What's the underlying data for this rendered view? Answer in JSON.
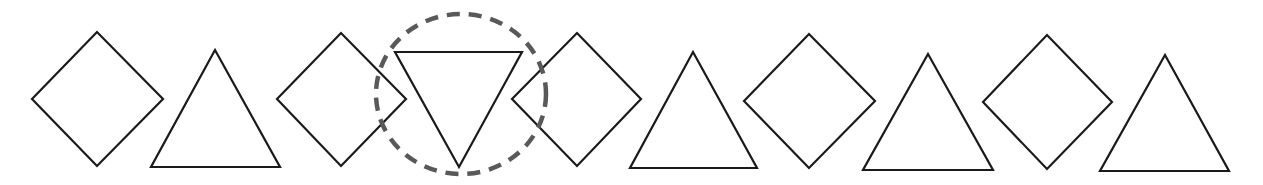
{
  "diagram": {
    "title": "",
    "stroke_color": "#1a1a1a",
    "highlight_color": "#595959",
    "shapes": [
      {
        "index": 1,
        "type": "diamond",
        "points": "32,99 97,32 163,99 97,166"
      },
      {
        "index": 2,
        "type": "triangle-up",
        "points": "215,50 280,167 151,167"
      },
      {
        "index": 3,
        "type": "diamond",
        "points": "277,99 341,33 406,99 341,166"
      },
      {
        "index": 4,
        "type": "triangle-down",
        "points": "395,52 522,52 459,167",
        "highlighted": true
      },
      {
        "index": 5,
        "type": "diamond",
        "points": "512,99 577,33 641,99 577,166"
      },
      {
        "index": 6,
        "type": "triangle-up",
        "points": "693,52 757,168 630,168"
      },
      {
        "index": 7,
        "type": "diamond",
        "points": "744,101 809,34 875,101 809,168"
      },
      {
        "index": 8,
        "type": "triangle-up",
        "points": "928,54 993,170 863,170"
      },
      {
        "index": 9,
        "type": "diamond",
        "points": "983,102 1047,35 1112,102 1047,169"
      },
      {
        "index": 10,
        "type": "triangle-up",
        "points": "1165,55 1229,171 1100,171"
      }
    ],
    "highlight": {
      "shape": "dashed-circle",
      "target_index": 4,
      "cx": 461,
      "cy": 94,
      "rx": 85,
      "ry": 80
    }
  }
}
